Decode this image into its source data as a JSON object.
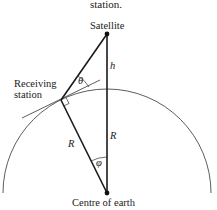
{
  "diagram": {
    "caption_fragment": "station.",
    "labels": {
      "satellite": "Satellite",
      "receiving_station_line1": "Receiving",
      "receiving_station_line2": "station",
      "centre": "Centre of earth",
      "h": "h",
      "R_vertical": "R",
      "R_slant": "R",
      "theta": "θ",
      "phi": "φ"
    },
    "points": {
      "satellite": [
        107,
        34
      ],
      "receiving_station": [
        61,
        100
      ],
      "centre": [
        107,
        193
      ]
    },
    "colors": {
      "line": "#1a1a1a",
      "background": "#ffffff"
    }
  }
}
